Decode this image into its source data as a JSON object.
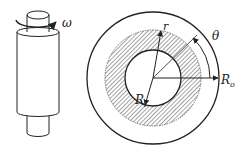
{
  "figure": {
    "left": {
      "description": "Rotating cylinder (shaft inside outer cylinder)",
      "omega_label": "ω"
    },
    "right": {
      "description": "Cross-section: inner rotating circle, hatched annulus, outer circle",
      "labels": {
        "r": "r",
        "theta": "θ",
        "Ri": "R",
        "Ri_sub": "i",
        "Ro": "R",
        "Ro_sub": "o"
      }
    }
  },
  "colors": {
    "stroke": "#222222",
    "hatch": "#555555",
    "background": "#ffffff"
  }
}
